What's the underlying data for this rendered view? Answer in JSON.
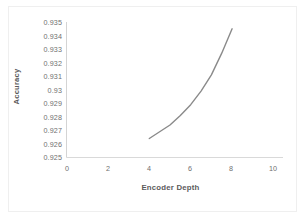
{
  "chart_data": {
    "type": "line",
    "title": "",
    "subtitle": "",
    "xlabel": "Encoder Depth",
    "ylabel": "Accuracy",
    "xlim": [
      0,
      10
    ],
    "ylim": [
      0.925,
      0.935
    ],
    "xticks": [
      "0",
      "2",
      "4",
      "6",
      "8",
      "10"
    ],
    "yticks": [
      "0.935",
      "0.934",
      "0.933",
      "0.932",
      "0.931",
      "0.93",
      "0.929",
      "0.928",
      "0.927",
      "0.926",
      "0.925"
    ],
    "grid": false,
    "legend": false,
    "legend_position": "none",
    "line_color": "#8a8a8a",
    "series": [
      {
        "name": "Accuracy",
        "x": [
          4,
          4.5,
          5,
          5.5,
          6,
          6.5,
          7,
          7.5,
          8
        ],
        "values": [
          0.9264,
          0.9269,
          0.9274,
          0.9281,
          0.9289,
          0.9299,
          0.9311,
          0.9327,
          0.9345
        ]
      }
    ]
  },
  "axes": {
    "x_tick_labels": [
      "0",
      "2",
      "4",
      "6",
      "8",
      "10"
    ],
    "y_tick_labels": [
      "0.935",
      "0.934",
      "0.933",
      "0.932",
      "0.931",
      "0.93",
      "0.929",
      "0.928",
      "0.927",
      "0.926",
      "0.925"
    ],
    "x_title": "Encoder Depth",
    "y_title": "Accuracy"
  },
  "colors": {
    "line": "#8a8a8a",
    "axis": "#d4d4d4",
    "text": "#6f6f6f",
    "title_text": "#5b5b5b",
    "background": "#ffffff",
    "frame": "#efefef"
  }
}
